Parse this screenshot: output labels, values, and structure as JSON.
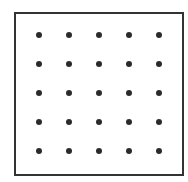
{
  "diagram": {
    "type": "dot-grid",
    "rows": 5,
    "columns": 5,
    "frame": {
      "shape": "square",
      "color": "#333333"
    },
    "dots": {
      "color": "#2b2b2b",
      "count": 25,
      "x_positions": [
        39,
        69,
        99,
        129,
        159
      ],
      "y_positions": [
        35,
        64,
        93,
        122,
        151
      ]
    }
  }
}
